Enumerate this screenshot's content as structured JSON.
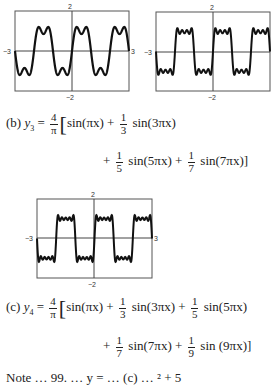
{
  "chart_data": [
    {
      "type": "line",
      "title": "",
      "description": "Fourier partial sum approximating a square wave (y2, 2 terms)",
      "function": "y2 = (4/pi)[sin(pi x) + (1/3) sin(3 pi x)]",
      "terms": [
        1,
        3
      ],
      "xlim": [
        -3,
        3
      ],
      "ylim": [
        -2,
        2
      ],
      "tick_labels": {
        "x_left": "-3",
        "x_right": "3",
        "y_top": "2",
        "y_bottom": "-2"
      },
      "grid": false
    },
    {
      "type": "line",
      "description": "Fourier partial sum approximating a square wave (y3, 4 terms), right edge cropped",
      "function": "y3 = (4/pi)[sin(pi x) + (1/3) sin(3 pi x) + (1/5) sin(5 pi x) + (1/7) sin(7 pi x)]",
      "terms": [
        1,
        3,
        5,
        7
      ],
      "xlim": [
        -3,
        3
      ],
      "ylim": [
        -2,
        2
      ],
      "tick_labels": {
        "x_left": "-3",
        "y_top": "2",
        "y_bottom": "-2"
      },
      "grid": false
    },
    {
      "type": "line",
      "description": "Fourier partial sum approximating a square wave (y4, 5 terms)",
      "function": "y4 = (4/pi)[sin(pi x) + (1/3) sin(3 pi x) + (1/5) sin(5 pi x) + (1/7) sin(7 pi x) + (1/9) sin(9 pi x)]",
      "terms": [
        1,
        3,
        5,
        7,
        9
      ],
      "xlim": [
        -3,
        3
      ],
      "ylim": [
        -2,
        2
      ],
      "tick_labels": {
        "x_left": "-3",
        "x_right": "3",
        "y_top": "2",
        "y_bottom": "-2"
      },
      "grid": false
    }
  ],
  "graphs": {
    "g1": {
      "x_left": "−3",
      "x_right": "3",
      "y_top": "2",
      "y_bottom": "−2"
    },
    "g2": {
      "x_left": "−3",
      "y_top": "2",
      "y_bottom": "−2"
    },
    "g3": {
      "x_left": "−3",
      "x_right": "3",
      "y_top": "2",
      "y_bottom": "−2"
    }
  },
  "equations": {
    "b": {
      "label": "(b)",
      "lhs": "y",
      "lhs_sub": "3",
      "coef_num": "4",
      "coef_den": "π",
      "t1": "sin(πx)",
      "plus": "+",
      "f3_num": "1",
      "f3_den": "3",
      "t3": "sin(3πx)",
      "f5_num": "1",
      "f5_den": "5",
      "t5": "sin(5πx)",
      "f7_num": "1",
      "f7_den": "7",
      "t7": "sin(7πx)]"
    },
    "c": {
      "label": "(c)",
      "lhs": "y",
      "lhs_sub": "4",
      "coef_num": "4",
      "coef_den": "π",
      "t1": "sin(πx)",
      "plus": "+",
      "f3_num": "1",
      "f3_den": "3",
      "t3": "sin(3πx)",
      "f5_num": "1",
      "f5_den": "5",
      "t5": "sin(5πx)",
      "f7_num": "1",
      "f7_den": "7",
      "t7": "sin(7πx)",
      "f9_num": "1",
      "f9_den": "9",
      "t9": "sin (9πx)]"
    }
  },
  "cutoff_text": "Note … 99. … y = … (c) … ² + 5"
}
